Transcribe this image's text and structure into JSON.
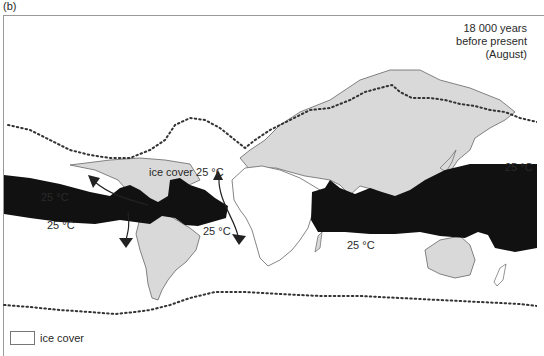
{
  "figure": {
    "panel_label": "(b)",
    "title_lines": [
      "18 000 years",
      "before present",
      "(August)"
    ]
  },
  "annotations": {
    "ice_cover_label": "ice cover 25 °C",
    "pacific_east_north": "25 °C",
    "pacific_east_south": "25 °C",
    "atlantic_south": "25 °C",
    "indian_ocean": "25 °C",
    "pacific_west": "25 °C"
  },
  "legend": {
    "items": [
      {
        "swatch": "white box",
        "label": "ice cover"
      }
    ]
  },
  "colors": {
    "land": "#d9d9d9",
    "warm_water": "#111111",
    "ocean": "#ffffff",
    "ice_edge_dots": "#333333",
    "coast": "#666666"
  }
}
